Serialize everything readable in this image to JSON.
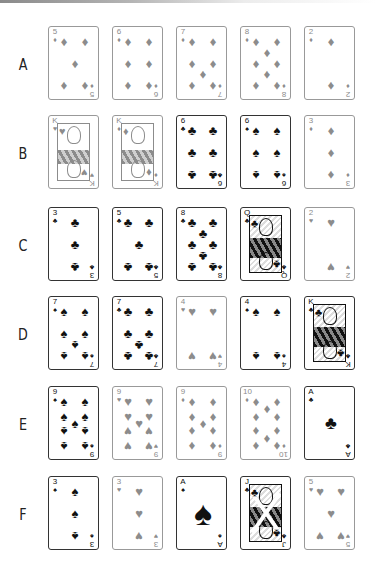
{
  "colors": {
    "red_suit": "#8c8c8c",
    "black_suit": "#111111",
    "red_border": "#999999",
    "black_border": "#333333"
  },
  "suits": {
    "diamonds": "♦",
    "hearts": "♥",
    "clubs": "♣",
    "spades": "♠"
  },
  "rows": [
    {
      "label": "A",
      "cards": [
        {
          "rank": "5",
          "suit": "diamonds",
          "color": "red"
        },
        {
          "rank": "6",
          "suit": "diamonds",
          "color": "red"
        },
        {
          "rank": "7",
          "suit": "diamonds",
          "color": "red"
        },
        {
          "rank": "8",
          "suit": "diamonds",
          "color": "red"
        },
        {
          "rank": "2",
          "suit": "diamonds",
          "color": "red"
        }
      ]
    },
    {
      "label": "B",
      "cards": [
        {
          "rank": "K",
          "suit": "hearts",
          "color": "red"
        },
        {
          "rank": "K",
          "suit": "diamonds",
          "color": "red"
        },
        {
          "rank": "6",
          "suit": "clubs",
          "color": "black"
        },
        {
          "rank": "6",
          "suit": "spades",
          "color": "black"
        },
        {
          "rank": "3",
          "suit": "diamonds",
          "color": "red"
        }
      ]
    },
    {
      "label": "C",
      "cards": [
        {
          "rank": "3",
          "suit": "clubs",
          "color": "black"
        },
        {
          "rank": "5",
          "suit": "clubs",
          "color": "black"
        },
        {
          "rank": "8",
          "suit": "clubs",
          "color": "black"
        },
        {
          "rank": "Q",
          "suit": "clubs",
          "color": "black"
        },
        {
          "rank": "2",
          "suit": "hearts",
          "color": "red"
        }
      ]
    },
    {
      "label": "D",
      "cards": [
        {
          "rank": "7",
          "suit": "spades",
          "color": "black"
        },
        {
          "rank": "7",
          "suit": "clubs",
          "color": "black"
        },
        {
          "rank": "4",
          "suit": "hearts",
          "color": "red"
        },
        {
          "rank": "4",
          "suit": "spades",
          "color": "black"
        },
        {
          "rank": "K",
          "suit": "clubs",
          "color": "black"
        }
      ]
    },
    {
      "label": "E",
      "cards": [
        {
          "rank": "9",
          "suit": "spades",
          "color": "black"
        },
        {
          "rank": "9",
          "suit": "hearts",
          "color": "red"
        },
        {
          "rank": "9",
          "suit": "diamonds",
          "color": "red"
        },
        {
          "rank": "10",
          "suit": "diamonds",
          "color": "red"
        },
        {
          "rank": "A",
          "suit": "clubs",
          "color": "black"
        }
      ]
    },
    {
      "label": "F",
      "cards": [
        {
          "rank": "3",
          "suit": "spades",
          "color": "black"
        },
        {
          "rank": "3",
          "suit": "hearts",
          "color": "red"
        },
        {
          "rank": "A",
          "suit": "spades",
          "color": "black"
        },
        {
          "rank": "J",
          "suit": "clubs",
          "color": "black"
        },
        {
          "rank": "5",
          "suit": "hearts",
          "color": "red"
        }
      ]
    }
  ]
}
